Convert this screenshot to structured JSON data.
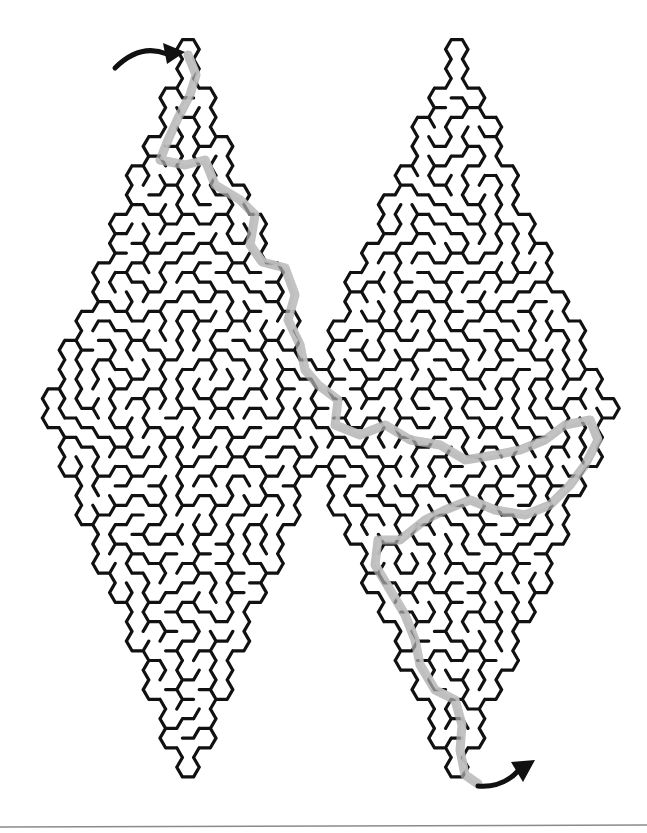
{
  "puzzle": {
    "title": "Double Diamond Hexagonal Maze",
    "type": "maze",
    "cell_shape": "hexagon",
    "solved": true,
    "colors": {
      "background": "#ffffff",
      "walls": "#111111",
      "solution_path": "#a9a9a9",
      "arrows": "#111111",
      "bottom_rule": "#8a8a8a"
    },
    "regions": [
      {
        "name": "left-diamond",
        "top": [
          190,
          45
        ],
        "bottom": [
          195,
          785
        ],
        "left": [
          45,
          410
        ],
        "right": [
          330,
          410
        ]
      },
      {
        "name": "right-diamond",
        "top": [
          455,
          45
        ],
        "bottom": [
          460,
          785
        ],
        "left": [
          300,
          430
        ],
        "right": [
          612,
          410
        ]
      }
    ],
    "entrance": {
      "label": "start-arrow",
      "from": [
        115,
        68
      ],
      "to": [
        185,
        52
      ]
    },
    "exit": {
      "label": "end-arrow",
      "from": [
        478,
        786
      ],
      "to": [
        535,
        760
      ]
    },
    "solution_path": [
      [
        188,
        55
      ],
      [
        196,
        75
      ],
      [
        190,
        95
      ],
      [
        178,
        118
      ],
      [
        168,
        140
      ],
      [
        160,
        160
      ],
      [
        185,
        165
      ],
      [
        205,
        160
      ],
      [
        215,
        185
      ],
      [
        240,
        200
      ],
      [
        255,
        215
      ],
      [
        250,
        245
      ],
      [
        262,
        262
      ],
      [
        285,
        268
      ],
      [
        295,
        295
      ],
      [
        288,
        320
      ],
      [
        300,
        345
      ],
      [
        305,
        370
      ],
      [
        318,
        385
      ],
      [
        338,
        400
      ],
      [
        335,
        425
      ],
      [
        360,
        435
      ],
      [
        385,
        425
      ],
      [
        410,
        440
      ],
      [
        440,
        445
      ],
      [
        465,
        460
      ],
      [
        495,
        455
      ],
      [
        520,
        450
      ],
      [
        545,
        440
      ],
      [
        565,
        425
      ],
      [
        590,
        420
      ],
      [
        598,
        440
      ],
      [
        585,
        465
      ],
      [
        570,
        485
      ],
      [
        550,
        505
      ],
      [
        525,
        515
      ],
      [
        495,
        510
      ],
      [
        470,
        500
      ],
      [
        445,
        510
      ],
      [
        425,
        520
      ],
      [
        400,
        540
      ],
      [
        378,
        540
      ],
      [
        375,
        565
      ],
      [
        390,
        590
      ],
      [
        405,
        615
      ],
      [
        415,
        640
      ],
      [
        420,
        665
      ],
      [
        435,
        690
      ],
      [
        455,
        700
      ],
      [
        462,
        725
      ],
      [
        460,
        750
      ],
      [
        465,
        775
      ],
      [
        478,
        784
      ]
    ]
  }
}
